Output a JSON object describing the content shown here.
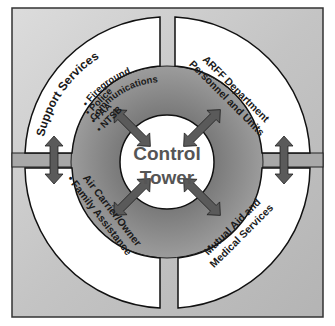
{
  "center": {
    "line1": "Control",
    "line2": "Tower"
  },
  "quadrants": {
    "top_left": {
      "title": "Support Services",
      "items": [
        "• Police",
        "• FAA",
        "• NTSB",
        "• Fireground",
        "Communications"
      ]
    },
    "top_right": {
      "line1": "ARFF Department",
      "line2": "Personnel and Units"
    },
    "bottom_left": {
      "line1": "Air Carrier/Owner",
      "line2": "• Family Assistance"
    },
    "bottom_right": {
      "line1": "Mutual Aid and",
      "line2": "Medical Services"
    }
  },
  "colors": {
    "frame_bg_light": "#d6d6d6",
    "frame_bg_dark": "#a9a9a9",
    "ring": "#8e8e8e",
    "arrow": "#5a5a5a",
    "panel": "#ffffff",
    "text": "#1a1a1a",
    "center_text": "#555555"
  }
}
